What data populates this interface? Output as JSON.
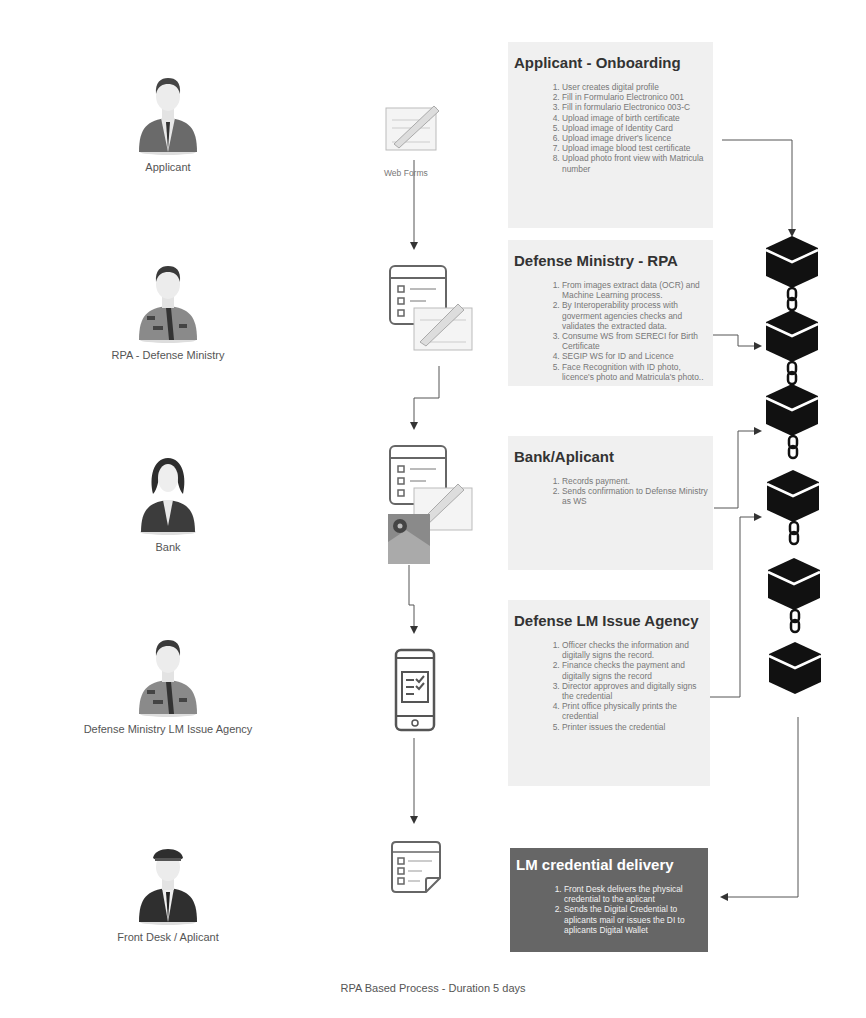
{
  "footer": {
    "caption": "RPA Based Process - Duration 5 days"
  },
  "actors": [
    {
      "label": "Applicant",
      "icon": "businessman-avatar-icon"
    },
    {
      "label": "RPA - Defense Ministry",
      "icon": "officer-avatar-icon"
    },
    {
      "label": "Bank",
      "icon": "businesswoman-avatar-icon"
    },
    {
      "label": "Defense Ministry LM Issue Agency",
      "icon": "officer-avatar-icon"
    },
    {
      "label": "Front Desk / Aplicant",
      "icon": "pilot-avatar-icon"
    }
  ],
  "steps_icons": [
    {
      "name": "web-form-icon",
      "label": "Web Forms"
    },
    {
      "name": "checklist-and-form-icon"
    },
    {
      "name": "checklist-form-map-icon"
    },
    {
      "name": "mobile-checklist-icon"
    },
    {
      "name": "checklist-note-icon"
    }
  ],
  "cards": [
    {
      "title": "Applicant - Onboarding",
      "items": [
        "User creates digital profile",
        "Fill in Formulario Electronico 001",
        "Fill in formulario Electronico 003-C",
        "Upload image of birth certificate",
        "Upload image of Identity Card",
        "Upload image driver's licence",
        "Upload image blood test certificate",
        "Upload photo front view with Matricula number"
      ]
    },
    {
      "title": "Defense Ministry - RPA",
      "items": [
        "From images extract data (OCR) and Machine Learning process.",
        "By Interoperability process with goverment agencies checks and validates the extracted data.",
        "Consume WS from SERECI for Birth Certificate",
        "SEGIP WS for ID and Licence",
        "Face Recognition with ID photo, licence's photo and Matricula's photo.."
      ]
    },
    {
      "title": "Bank/Aplicant",
      "items": [
        "Records payment.",
        "Sends confirmation to Defense Ministry as WS"
      ]
    },
    {
      "title": "Defense LM Issue Agency",
      "items": [
        "Officer checks the information and digitally signs the record.",
        "Finance checks the payment and digitally signs the record",
        "Director approves and digitally signs the credential",
        "Print office physically prints the credential",
        "Printer issues the credential"
      ]
    },
    {
      "title": "LM credential delivery",
      "items": [
        "Front Desk delivers the physical credential to the aplicant",
        "Sends the Digital Credential to aplicants mail or issues the DI to aplicants Digital Wallet"
      ]
    }
  ],
  "blockchain": {
    "block_count": 6,
    "block_icon": "blockchain-block-icon",
    "link_icon": "chain-link-icon",
    "block_color": "#111111"
  },
  "colors": {
    "card_light": "#f0f0f0",
    "card_dark": "#666666",
    "connector": "#555555"
  }
}
